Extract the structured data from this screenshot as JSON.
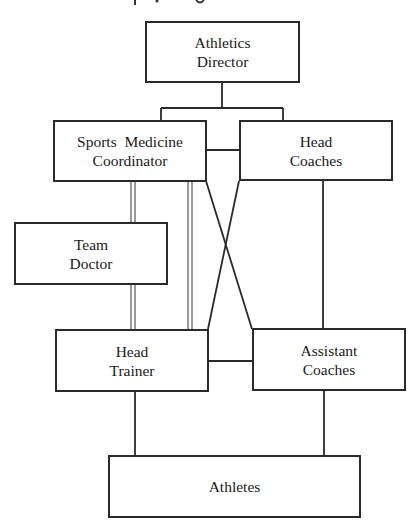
{
  "diagram": {
    "type": "organizational-chart",
    "colors": {
      "line": "#2a2a2a",
      "box_border": "#2a2a2a",
      "background": "#ffffff",
      "text": "#1a1a1a"
    },
    "nodes": {
      "athletics_director": {
        "line1": "Athletics",
        "line2": "Director"
      },
      "sports_medicine_coordinator": {
        "line1": "Sports  Medicine",
        "line2": "Coordinator"
      },
      "head_coaches": {
        "line1": "Head",
        "line2": "Coaches"
      },
      "team_doctor": {
        "line1": "Team",
        "line2": "Doctor"
      },
      "head_trainer": {
        "line1": "Head",
        "line2": "Trainer"
      },
      "assistant_coaches": {
        "line1": "Assistant",
        "line2": "Coaches"
      },
      "athletes": {
        "line1": "Athletes"
      }
    },
    "edges": [
      {
        "from": "Athletics Director",
        "to": "Sports Medicine Coordinator",
        "style": "single"
      },
      {
        "from": "Athletics Director",
        "to": "Head Coaches",
        "style": "single"
      },
      {
        "from": "Sports Medicine Coordinator",
        "to": "Head Coaches",
        "style": "single"
      },
      {
        "from": "Sports Medicine Coordinator",
        "to": "Team Doctor",
        "style": "double"
      },
      {
        "from": "Sports Medicine Coordinator",
        "to": "Head Trainer",
        "style": "double"
      },
      {
        "from": "Team Doctor",
        "to": "Head Trainer",
        "style": "double"
      },
      {
        "from": "Sports Medicine Coordinator",
        "to": "Assistant Coaches",
        "style": "single"
      },
      {
        "from": "Head Coaches",
        "to": "Head Trainer",
        "style": "single"
      },
      {
        "from": "Head Coaches",
        "to": "Assistant Coaches",
        "style": "single"
      },
      {
        "from": "Head Trainer",
        "to": "Assistant Coaches",
        "style": "single"
      },
      {
        "from": "Head Trainer",
        "to": "Athletes",
        "style": "single"
      },
      {
        "from": "Assistant Coaches",
        "to": "Athletes",
        "style": "single"
      }
    ]
  }
}
